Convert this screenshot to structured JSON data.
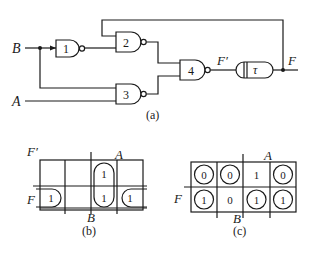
{
  "circuit": {
    "caption": "(a)",
    "inputs": {
      "b": "B",
      "a": "A"
    },
    "gates": [
      {
        "id": "1",
        "label": "1",
        "type": "NAND"
      },
      {
        "id": "2",
        "label": "2",
        "type": "NAND"
      },
      {
        "id": "3",
        "label": "3",
        "type": "NAND"
      },
      {
        "id": "4",
        "label": "4",
        "type": "NAND"
      }
    ],
    "delay": {
      "label": "τ"
    },
    "signals": {
      "f_prime": "F′",
      "f": "F"
    }
  },
  "kmap_b": {
    "caption": "(b)",
    "labels": {
      "f_prime": "F′",
      "f": "F",
      "a": "A",
      "b": "B"
    },
    "rows": [
      [
        "",
        "",
        "1",
        ""
      ],
      [
        "1",
        "",
        "1",
        "1"
      ]
    ]
  },
  "kmap_c": {
    "caption": "(c)",
    "labels": {
      "f": "F",
      "a": "A",
      "b": "B"
    },
    "rows": [
      [
        "0",
        "0",
        "1",
        "0"
      ],
      [
        "1",
        "0",
        "1",
        "1"
      ]
    ],
    "circled": [
      [
        true,
        true,
        false,
        true
      ],
      [
        true,
        false,
        true,
        true
      ]
    ]
  },
  "colors": {
    "ink": "#1a1a1a",
    "background": "#ffffff"
  }
}
